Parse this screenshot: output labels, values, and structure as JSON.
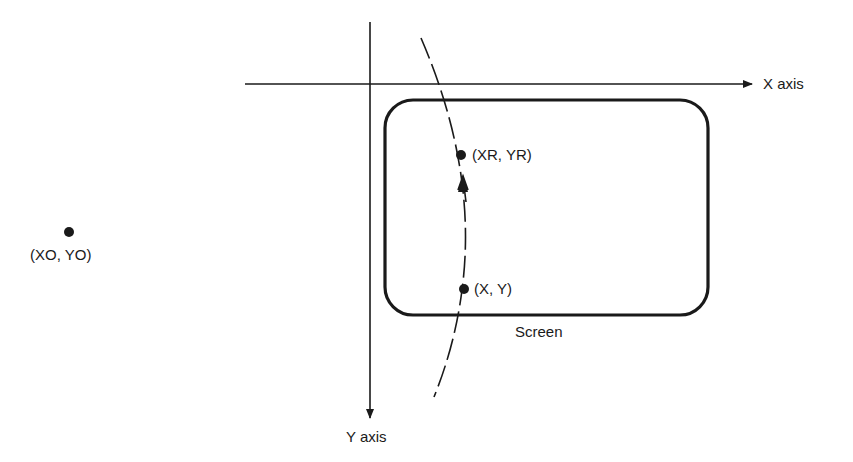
{
  "diagram": {
    "type": "coordinate-rotation",
    "axes": {
      "x_label": "X axis",
      "y_label": "Y axis"
    },
    "screen": {
      "label": "Screen"
    },
    "points": {
      "center": {
        "label": "(XO, YO)"
      },
      "rotated": {
        "label": "(XR, YR)"
      },
      "original": {
        "label": "(X, Y)"
      }
    },
    "colors": {
      "ink": "#1a1a1a",
      "background": "#ffffff"
    }
  }
}
